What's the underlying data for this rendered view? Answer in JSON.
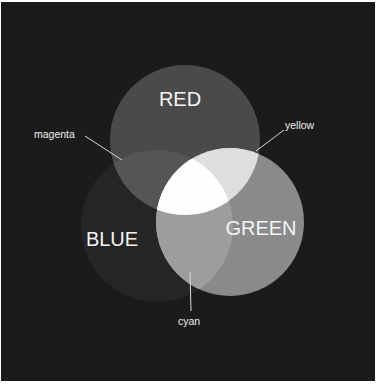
{
  "diagram": {
    "type": "venn",
    "title": "",
    "background": "#1b1b1b",
    "circles": [
      {
        "id": "red",
        "label": "RED",
        "cx": 185,
        "cy": 140,
        "r": 75,
        "fill": "#4a4a4a"
      },
      {
        "id": "blue",
        "label": "BLUE",
        "cx": 157,
        "cy": 226,
        "r": 76,
        "fill": "#252525"
      },
      {
        "id": "green",
        "label": "GREEN",
        "cx": 230,
        "cy": 222,
        "r": 74,
        "fill": "#8a8a8a"
      }
    ],
    "overlaps": [
      {
        "id": "magenta",
        "label": "magenta",
        "sets": [
          "red",
          "blue"
        ],
        "fill": "#555555"
      },
      {
        "id": "yellow",
        "label": "yellow",
        "sets": [
          "red",
          "green"
        ],
        "fill": "#dedede"
      },
      {
        "id": "cyan",
        "label": "cyan",
        "sets": [
          "blue",
          "green"
        ],
        "fill": "#9d9d9d"
      },
      {
        "id": "white",
        "label": "",
        "sets": [
          "red",
          "green",
          "blue"
        ],
        "fill": "#fefefe"
      }
    ],
    "labels": {
      "red": "RED",
      "green": "GREEN",
      "blue": "BLUE",
      "magenta": "magenta",
      "yellow": "yellow",
      "cyan": "cyan"
    }
  }
}
